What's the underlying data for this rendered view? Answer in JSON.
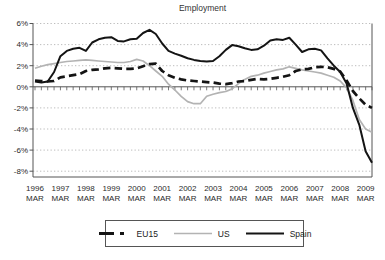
{
  "title": "Employment",
  "chart_data": {
    "type": "line",
    "title": "Employment",
    "unit": "%",
    "frequency": "quarterly",
    "x_start": "1996-Q1",
    "x_end": "2009-Q2",
    "x_tick_labels": [
      {
        "year": "1996",
        "month": "MAR"
      },
      {
        "year": "1997",
        "month": "MAR"
      },
      {
        "year": "1998",
        "month": "MAR"
      },
      {
        "year": "1999",
        "month": "MAR"
      },
      {
        "year": "2000",
        "month": "MAR"
      },
      {
        "year": "2001",
        "month": "MAR"
      },
      {
        "year": "2002",
        "month": "MAR"
      },
      {
        "year": "2003",
        "month": "MAR"
      },
      {
        "year": "2004",
        "month": "MAR"
      },
      {
        "year": "2005",
        "month": "MAR"
      },
      {
        "year": "2006",
        "month": "MAR"
      },
      {
        "year": "2007",
        "month": "MAR"
      },
      {
        "year": "2008",
        "month": "MAR"
      },
      {
        "year": "2009",
        "month": "MAR"
      }
    ],
    "y_ticks": [
      6,
      4,
      2,
      0,
      -2,
      -4,
      -6,
      -8
    ],
    "y_tick_labels": [
      "6%",
      "4%",
      "2%",
      "0%",
      "-2%",
      "-4%",
      "-6%",
      "-8%"
    ],
    "ylim": [
      -8,
      6
    ],
    "grid": "dotted-horizontal",
    "legend_position": "bottom",
    "series": [
      {
        "name": "EU15",
        "style": "dashed",
        "color": "#141414",
        "values": [
          0.6,
          0.55,
          0.5,
          0.55,
          0.9,
          1.0,
          1.1,
          1.2,
          1.5,
          1.6,
          1.65,
          1.75,
          1.8,
          1.75,
          1.7,
          1.7,
          1.75,
          1.95,
          2.15,
          2.2,
          1.5,
          1.1,
          0.85,
          0.7,
          0.6,
          0.55,
          0.5,
          0.45,
          0.4,
          0.3,
          0.25,
          0.35,
          0.5,
          0.55,
          0.65,
          0.75,
          0.7,
          0.75,
          0.85,
          0.95,
          1.1,
          1.5,
          1.65,
          1.7,
          1.85,
          1.9,
          1.85,
          1.7,
          1.45,
          0.6,
          -0.4,
          -1.1,
          -1.7,
          -2.0
        ]
      },
      {
        "name": "US",
        "style": "solid",
        "color": "#b3b3b3",
        "values": [
          1.75,
          1.95,
          2.1,
          2.2,
          2.3,
          2.4,
          2.45,
          2.5,
          2.55,
          2.5,
          2.45,
          2.4,
          2.35,
          2.3,
          2.3,
          2.4,
          2.6,
          2.45,
          2.0,
          1.5,
          1.0,
          0.25,
          -0.3,
          -0.9,
          -1.4,
          -1.6,
          -1.6,
          -0.9,
          -0.7,
          -0.55,
          -0.45,
          -0.2,
          0.3,
          0.7,
          1.0,
          1.1,
          1.3,
          1.45,
          1.6,
          1.7,
          1.9,
          1.75,
          1.6,
          1.5,
          1.4,
          1.3,
          1.1,
          0.9,
          0.55,
          -0.1,
          -1.3,
          -3.1,
          -4.0,
          -4.3
        ]
      },
      {
        "name": "Spain",
        "style": "solid",
        "color": "#141414",
        "values": [
          0.5,
          0.4,
          0.5,
          1.4,
          2.9,
          3.4,
          3.6,
          3.7,
          3.4,
          4.2,
          4.5,
          4.65,
          4.7,
          4.35,
          4.3,
          4.5,
          4.55,
          5.1,
          5.4,
          5.0,
          4.1,
          3.4,
          3.15,
          2.95,
          2.7,
          2.55,
          2.45,
          2.4,
          2.45,
          2.9,
          3.5,
          3.95,
          3.85,
          3.65,
          3.5,
          3.55,
          3.9,
          4.4,
          4.5,
          4.45,
          4.65,
          4.0,
          3.3,
          3.55,
          3.6,
          3.45,
          2.7,
          2.0,
          1.4,
          0.3,
          -2.0,
          -3.6,
          -6.1,
          -7.2
        ]
      }
    ]
  }
}
